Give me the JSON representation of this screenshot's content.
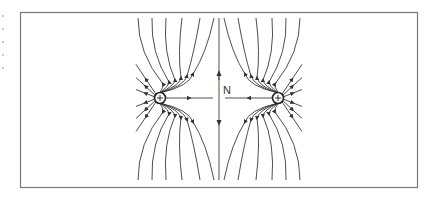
{
  "diagram": {
    "frame": {
      "x": 20,
      "y": 12,
      "width": 398,
      "height": 176,
      "stroke": "#666666"
    },
    "line_color": "#3a3a3a",
    "charges": [
      {
        "id": "left",
        "x": 160,
        "y": 98,
        "r": 5.5,
        "sign": "+"
      },
      {
        "id": "right",
        "x": 278,
        "y": 98,
        "r": 5.5,
        "sign": "+"
      }
    ],
    "neutral_point": {
      "label": "N",
      "x": 219,
      "y": 98
    },
    "midline_x": 219
  }
}
